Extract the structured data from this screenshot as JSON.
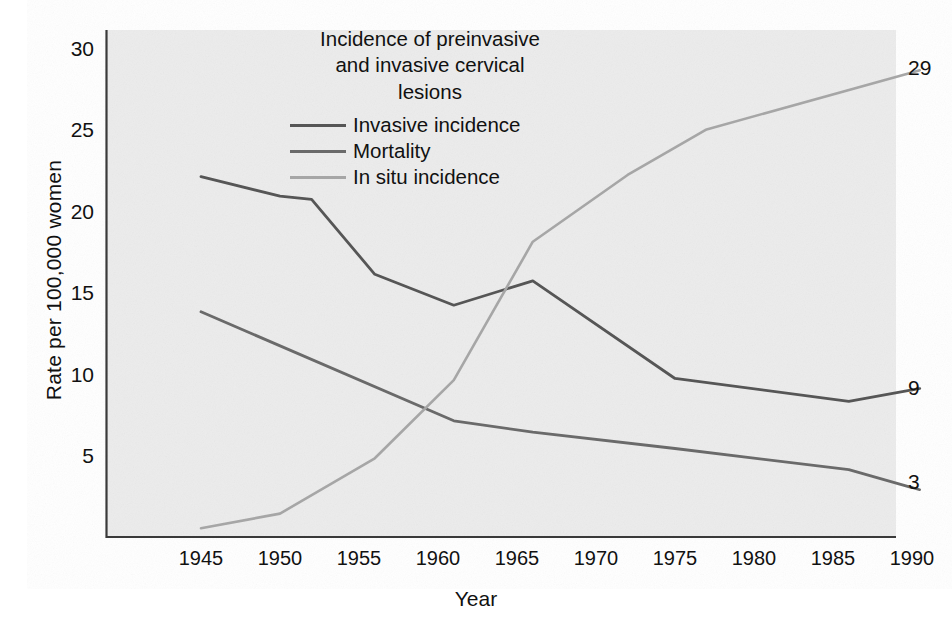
{
  "chart_data": {
    "type": "line",
    "title": "Incidence of preinvasive and invasive cervical lesions",
    "title_lines": [
      "Incidence of preinvasive",
      "and invasive cervical",
      "lesions"
    ],
    "xlabel": "Year",
    "ylabel": "Rate per 100,000 women",
    "grid": false,
    "legend_position": "top-center-inside",
    "xlim": [
      1942,
      1992
    ],
    "ylim": [
      0,
      31
    ],
    "xticks": [
      1945,
      1950,
      1955,
      1960,
      1965,
      1970,
      1975,
      1980,
      1985,
      1990
    ],
    "xtick_labels": [
      "1945",
      "1950",
      "1955",
      "1960",
      "1965",
      "1970",
      "1975",
      "1980",
      "1985",
      "1990"
    ],
    "yticks": [
      5,
      10,
      15,
      20,
      25,
      30
    ],
    "ytick_labels": [
      "5",
      "10",
      "15",
      "20",
      "25",
      "30"
    ],
    "series": [
      {
        "name": "Invasive incidence",
        "color": "#565656",
        "x": [
          1945,
          1950,
          1952,
          1956,
          1961,
          1966,
          1975,
          1986,
          1990
        ],
        "values": [
          22.1,
          20.9,
          20.7,
          16.1,
          14.2,
          15.7,
          9.7,
          8.3,
          9.0
        ],
        "end_label": "9"
      },
      {
        "name": "Mortality",
        "color": "#6a6a6a",
        "x": [
          1945,
          1961,
          1966,
          1975,
          1986,
          1990
        ],
        "values": [
          13.8,
          7.1,
          6.4,
          5.4,
          4.1,
          3.0
        ],
        "end_label": "3"
      },
      {
        "name": "In situ incidence",
        "color": "#a6a6a6",
        "x": [
          1945,
          1950,
          1956,
          1961,
          1966,
          1972,
          1977,
          1990
        ],
        "values": [
          0.5,
          1.4,
          4.8,
          9.6,
          18.1,
          22.2,
          25.0,
          28.5
        ],
        "end_label": "29"
      }
    ],
    "end_labels": [
      {
        "text": "29",
        "series": "In situ incidence"
      },
      {
        "text": "9",
        "series": "Invasive incidence"
      },
      {
        "text": "3",
        "series": "Mortality"
      }
    ],
    "colors": {
      "plot_background": "#ececec",
      "axis": "#3a3a3a",
      "text": "#111111",
      "invasive": "#565656",
      "mortality": "#6a6a6a",
      "in_situ": "#a6a6a6"
    }
  }
}
